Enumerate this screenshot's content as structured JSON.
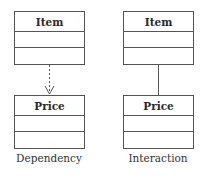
{
  "diagrams": [
    {
      "caption": "Dependency",
      "connector": "dashed-arrow",
      "top_class": {
        "name": "Item",
        "compartments": [
          "",
          ""
        ]
      },
      "bottom_class": {
        "name": "Price",
        "compartments": [
          "",
          ""
        ]
      }
    },
    {
      "caption": "Interaction",
      "connector": "solid-line",
      "top_class": {
        "name": "Item",
        "compartments": [
          "",
          ""
        ]
      },
      "bottom_class": {
        "name": "Price",
        "compartments": [
          "",
          ""
        ]
      }
    }
  ],
  "colors": {
    "stroke": "#555555",
    "text": "#2a2a2a",
    "background": "#ffffff"
  }
}
